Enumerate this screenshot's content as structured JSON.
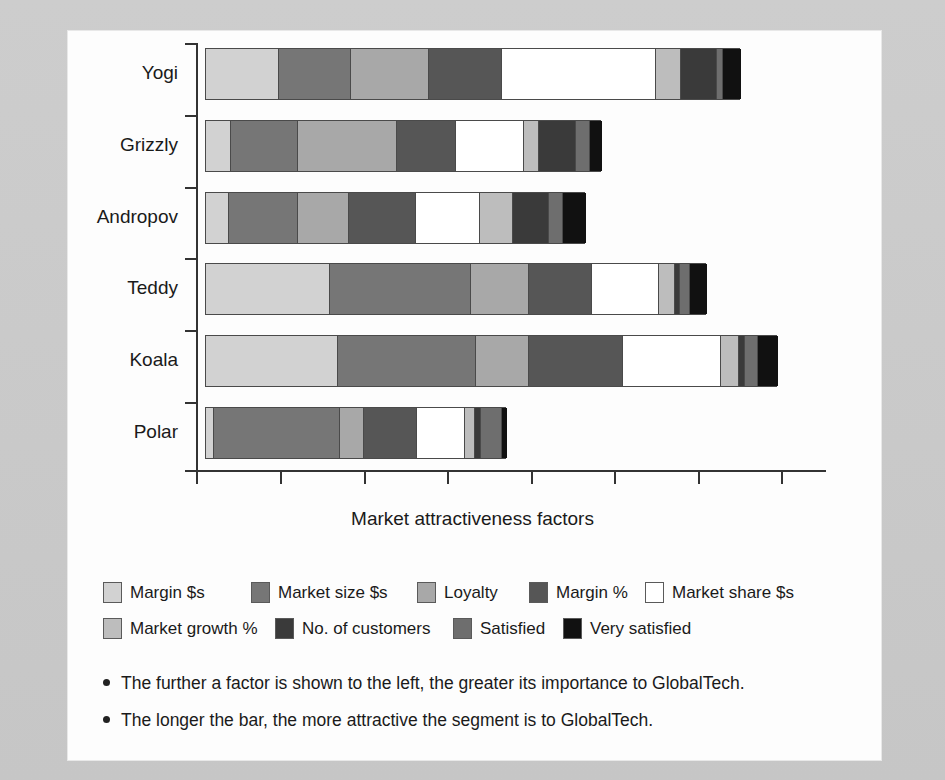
{
  "chart_data": {
    "type": "bar",
    "orientation": "horizontal",
    "stacked": true,
    "title": "",
    "xlabel": "Market attractiveness factors",
    "ylabel": "",
    "grid": false,
    "xlim": [
      0,
      7.5
    ],
    "x_tick_values": [
      0,
      1,
      2,
      3,
      4,
      5,
      6,
      7
    ],
    "x_tick_labels": [
      "",
      "",
      "",
      "",
      "",
      "",
      "",
      ""
    ],
    "categories": [
      "Yogi",
      "Grizzly",
      "Andropov",
      "Teddy",
      "Koala",
      "Polar"
    ],
    "legend_position": "below",
    "series": [
      {
        "name": "Margin $s",
        "color": "#d2d2d2",
        "values": [
          0.87,
          0.3,
          0.27,
          1.48,
          1.57,
          0.1
        ]
      },
      {
        "name": "Market size $s",
        "color": "#767676",
        "values": [
          0.86,
          0.8,
          0.83,
          1.68,
          1.64,
          1.49
        ]
      },
      {
        "name": "Loyalty",
        "color": "#a8a8a8",
        "values": [
          0.93,
          1.17,
          0.6,
          0.69,
          0.63,
          0.29
        ]
      },
      {
        "name": "Margin %",
        "color": "#565656",
        "values": [
          0.86,
          0.71,
          0.8,
          0.74,
          1.12,
          0.63
        ]
      },
      {
        "name": "Market share $s",
        "color": "#ffffff",
        "values": [
          1.84,
          0.81,
          0.76,
          0.8,
          1.17,
          0.57
        ]
      },
      {
        "name": "Market growth %",
        "color": "#bdbdbd",
        "values": [
          0.3,
          0.17,
          0.4,
          0.19,
          0.21,
          0.12
        ]
      },
      {
        "name": "No. of customers",
        "color": "#3a3a3a",
        "values": [
          0.42,
          0.44,
          0.42,
          0.06,
          0.08,
          0.08
        ]
      },
      {
        "name": "Satisfied",
        "color": "#6e6e6e",
        "values": [
          0.08,
          0.17,
          0.17,
          0.12,
          0.15,
          0.24
        ]
      },
      {
        "name": "Very satisfied",
        "color": "#111111",
        "values": [
          0.21,
          0.14,
          0.27,
          0.2,
          0.24,
          0.06
        ]
      }
    ],
    "totals": [
      6.37,
      4.71,
      4.52,
      5.96,
      6.81,
      3.58
    ]
  },
  "axis": {
    "x_title": "Market attractiveness factors",
    "category_labels": [
      "Yogi",
      "Grizzly",
      "Andropov",
      "Teddy",
      "Koala",
      "Polar"
    ]
  },
  "legend": {
    "row1": [
      {
        "label": "Margin $s",
        "color": "#d2d2d2",
        "icon": "legend-swatch-icon"
      },
      {
        "label": "Market size $s",
        "color": "#767676",
        "icon": "legend-swatch-icon"
      },
      {
        "label": "Loyalty",
        "color": "#a8a8a8",
        "icon": "legend-swatch-icon"
      },
      {
        "label": "Margin %",
        "color": "#565656",
        "icon": "legend-swatch-icon"
      },
      {
        "label": "Market share $s",
        "color": "#ffffff",
        "icon": "legend-swatch-icon"
      }
    ],
    "row2": [
      {
        "label": "Market growth %",
        "color": "#bdbdbd",
        "icon": "legend-swatch-icon"
      },
      {
        "label": "No. of customers",
        "color": "#3a3a3a",
        "icon": "legend-swatch-icon"
      },
      {
        "label": "Satisfied",
        "color": "#6e6e6e",
        "icon": "legend-swatch-icon"
      },
      {
        "label": "Very satisfied",
        "color": "#111111",
        "icon": "legend-swatch-icon"
      }
    ]
  },
  "notes": [
    "The further a factor is shown to the left, the greater its importance to GlobalTech.",
    "The longer the bar, the more attractive the segment is to GlobalTech."
  ],
  "colors": {
    "page_background": "#c9c9c9",
    "chart_background": "#fdfdfd",
    "axis": "#333333",
    "text": "#1a1a1a",
    "segment_border": "#4a4a4a"
  },
  "geometry": {
    "origin_x": 196,
    "bar_start_x": 205,
    "unit_px": 84,
    "bar_height": 52,
    "bar_tops": [
      48,
      120,
      192,
      263,
      335,
      407
    ],
    "y_tick_y": [
      43,
      115,
      187,
      258,
      330,
      402,
      470
    ],
    "x_tick_x": [
      196,
      280,
      364,
      447,
      531,
      614,
      698,
      781
    ]
  }
}
